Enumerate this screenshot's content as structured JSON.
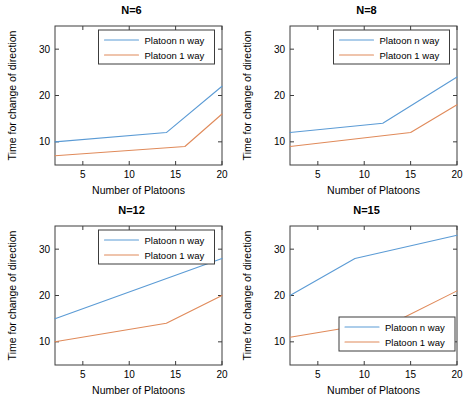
{
  "figure": {
    "background": "#ffffff",
    "layout": "2x2 subplot grid",
    "colors": {
      "series_n_way": "#5b9bd5",
      "series_1_way": "#e08a5a",
      "axis": "#3c3c3c",
      "text": "#000000"
    }
  },
  "common": {
    "xlabel": "Number of Platoons",
    "ylabel": "Time for change of direction",
    "xticks": [
      5,
      10,
      15,
      20
    ],
    "yticks": [
      10,
      20,
      30
    ],
    "xlim": [
      2,
      20
    ],
    "ylim": [
      5,
      35
    ],
    "legend_labels": [
      "Platoon n way",
      "Platoon 1 way"
    ]
  },
  "chart_data": [
    {
      "type": "line",
      "title": "N=6",
      "xlabel": "Number of Platoons",
      "ylabel": "Time for change of direction",
      "xlim": [
        2,
        20
      ],
      "ylim": [
        5,
        35
      ],
      "xticks": [
        5,
        10,
        15,
        20
      ],
      "yticks": [
        10,
        20,
        30
      ],
      "grid": false,
      "legend_position": "north",
      "x": [
        2,
        14,
        16,
        20
      ],
      "series": [
        {
          "name": "Platoon n way",
          "color": "#5b9bd5",
          "x": [
            2,
            14,
            20
          ],
          "values": [
            10,
            12,
            22
          ]
        },
        {
          "name": "Platoon 1 way",
          "color": "#e08a5a",
          "x": [
            2,
            16,
            20
          ],
          "values": [
            7,
            9,
            16
          ]
        }
      ]
    },
    {
      "type": "line",
      "title": "N=8",
      "xlabel": "Number of Platoons",
      "ylabel": "Time for change of direction",
      "xlim": [
        2,
        20
      ],
      "ylim": [
        5,
        35
      ],
      "xticks": [
        5,
        10,
        15,
        20
      ],
      "yticks": [
        10,
        20,
        30
      ],
      "grid": false,
      "legend_position": "north",
      "x": [
        2,
        12,
        15,
        20
      ],
      "series": [
        {
          "name": "Platoon n way",
          "color": "#5b9bd5",
          "x": [
            2,
            12,
            20
          ],
          "values": [
            12,
            14,
            24
          ]
        },
        {
          "name": "Platoon 1 way",
          "color": "#e08a5a",
          "x": [
            2,
            15,
            20
          ],
          "values": [
            9,
            12,
            18
          ]
        }
      ]
    },
    {
      "type": "line",
      "title": "N=12",
      "xlabel": "Number of Platoons",
      "ylabel": "Time for change of direction",
      "xlim": [
        2,
        20
      ],
      "ylim": [
        5,
        35
      ],
      "xticks": [
        5,
        10,
        15,
        20
      ],
      "yticks": [
        10,
        20,
        30
      ],
      "grid": false,
      "legend_position": "north",
      "x": [
        2,
        14,
        20
      ],
      "series": [
        {
          "name": "Platoon n way",
          "color": "#5b9bd5",
          "x": [
            2,
            20
          ],
          "values": [
            15,
            28
          ]
        },
        {
          "name": "Platoon 1 way",
          "color": "#e08a5a",
          "x": [
            2,
            14,
            20
          ],
          "values": [
            10,
            14,
            20
          ]
        }
      ]
    },
    {
      "type": "line",
      "title": "N=15",
      "xlabel": "Number of Platoons",
      "ylabel": "Time for change of direction",
      "xlim": [
        2,
        20
      ],
      "ylim": [
        5,
        35
      ],
      "xticks": [
        5,
        10,
        15,
        20
      ],
      "yticks": [
        10,
        20,
        30
      ],
      "grid": false,
      "legend_position": "southeast",
      "x": [
        2,
        9,
        14,
        20
      ],
      "series": [
        {
          "name": "Platoon n way",
          "color": "#5b9bd5",
          "x": [
            2,
            9,
            20
          ],
          "values": [
            20,
            28,
            33
          ]
        },
        {
          "name": "Platoon 1 way",
          "color": "#e08a5a",
          "x": [
            2,
            14,
            20
          ],
          "values": [
            11,
            15,
            21
          ]
        }
      ]
    }
  ]
}
